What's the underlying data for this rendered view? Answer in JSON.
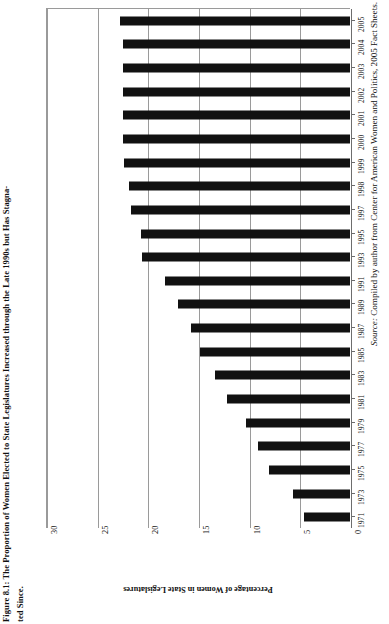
{
  "figure": {
    "title": "Figure 8.1: The Proportion of Women Elected to State Legislatures Increased through the Late 1990s but Has Stagna-",
    "title_line2": "ted Since.",
    "source_prefix": "Source:",
    "source_text": " Compiled by author from Center for American Women and Politics, 2005 Fact Sheets."
  },
  "chart_data": {
    "type": "bar",
    "orientation": "horizontal",
    "xlabel": "Percentage of Women in State Legislatures",
    "ylabel": "",
    "xlim": [
      0,
      30
    ],
    "xticks": [
      0,
      5,
      10,
      15,
      20,
      25,
      30
    ],
    "xticklabels": [
      "0",
      "5",
      "10",
      "15",
      "20",
      "25",
      "30"
    ],
    "grid": true,
    "legend": false,
    "categories": [
      "2005",
      "2004",
      "2003",
      "2002",
      "2001",
      "2000",
      "1999",
      "1998",
      "1997",
      "1995",
      "1993",
      "1991",
      "1989",
      "1987",
      "1985",
      "1983",
      "1981",
      "1979",
      "1977",
      "1975",
      "1973",
      "1971"
    ],
    "values": [
      22.7,
      22.4,
      22.4,
      22.4,
      22.4,
      22.4,
      22.3,
      21.8,
      21.6,
      20.6,
      20.5,
      18.3,
      17.0,
      15.7,
      14.8,
      13.3,
      12.1,
      10.3,
      9.1,
      8.0,
      5.6,
      4.5
    ],
    "series": [
      {
        "name": "Percentage of Women in State Legislatures",
        "values": [
          22.7,
          22.4,
          22.4,
          22.4,
          22.4,
          22.4,
          22.3,
          21.8,
          21.6,
          20.6,
          20.5,
          18.3,
          17.0,
          15.7,
          14.8,
          13.3,
          12.1,
          10.3,
          9.1,
          8.0,
          5.6,
          4.5
        ]
      }
    ],
    "bar_color": "#111111",
    "source": "Compiled by author from Center for American Women and Politics, 2005 Fact Sheets."
  }
}
